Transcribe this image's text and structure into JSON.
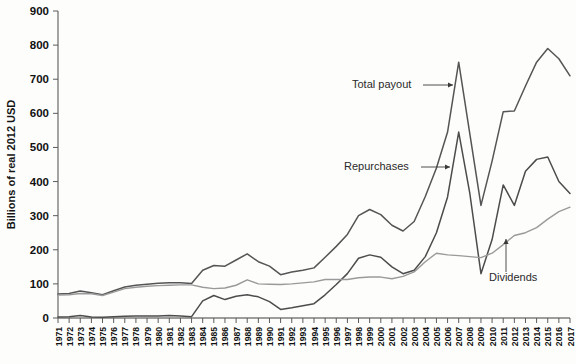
{
  "chart_data": {
    "type": "line",
    "title": "",
    "subtitle": "",
    "xlabel": "",
    "ylabel": "Billions of real 2012 USD",
    "ylim": [
      0,
      900
    ],
    "ytick_values": [
      0,
      100,
      200,
      300,
      400,
      500,
      600,
      700,
      800,
      900
    ],
    "ytick_labels": [
      "0",
      "100",
      "200",
      "300",
      "400",
      "500",
      "600",
      "700",
      "800",
      "900"
    ],
    "grid": false,
    "legend_position": "inline-annotations",
    "x": [
      1971,
      1972,
      1973,
      1974,
      1975,
      1976,
      1977,
      1978,
      1979,
      1980,
      1981,
      1982,
      1983,
      1984,
      1985,
      1986,
      1987,
      1988,
      1989,
      1990,
      1991,
      1992,
      1993,
      1994,
      1995,
      1996,
      1997,
      1998,
      1999,
      2000,
      2001,
      2002,
      2003,
      2004,
      2005,
      2006,
      2007,
      2008,
      2009,
      2010,
      2011,
      2012,
      2013,
      2014,
      2015,
      2016,
      2017
    ],
    "xtick_labels": [
      "1971",
      "1972",
      "1973",
      "1974",
      "1975",
      "1976",
      "1977",
      "1978",
      "1979",
      "1980",
      "1981",
      "1982",
      "1983",
      "1984",
      "1985",
      "1986",
      "1987",
      "1988",
      "1989",
      "1990",
      "1991",
      "1992",
      "1993",
      "1994",
      "1995",
      "1996",
      "1997",
      "1998",
      "1999",
      "2000",
      "2001",
      "2002",
      "2003",
      "2004",
      "2005",
      "2006",
      "2007",
      "2008",
      "2009",
      "2010",
      "2011",
      "2012",
      "2013",
      "2014",
      "2015",
      "2016",
      "2017"
    ],
    "series": [
      {
        "name": "Total payout",
        "color": "#555555",
        "values": [
          70,
          72,
          79,
          74,
          68,
          80,
          91,
          96,
          99,
          102,
          103,
          103,
          101,
          140,
          154,
          152,
          170,
          188,
          165,
          152,
          127,
          135,
          140,
          147,
          178,
          210,
          245,
          300,
          318,
          303,
          272,
          255,
          283,
          356,
          440,
          545,
          750,
          540,
          330,
          460,
          605,
          607,
          680,
          750,
          790,
          760,
          710
        ]
      },
      {
        "name": "Repurchases",
        "color": "#4c4c4c",
        "values": [
          3,
          4,
          7,
          3,
          2,
          4,
          5,
          6,
          6,
          6,
          7,
          6,
          4,
          50,
          66,
          54,
          64,
          68,
          62,
          48,
          25,
          30,
          36,
          42,
          68,
          98,
          130,
          175,
          185,
          178,
          150,
          130,
          140,
          180,
          250,
          355,
          545,
          365,
          130,
          230,
          390,
          330,
          430,
          465,
          472,
          400,
          365
        ]
      },
      {
        "name": "Dividends",
        "color": "#9a9a9a",
        "values": [
          67,
          68,
          72,
          71,
          66,
          76,
          86,
          90,
          93,
          95,
          96,
          97,
          97,
          90,
          86,
          88,
          96,
          112,
          100,
          99,
          98,
          100,
          103,
          106,
          113,
          113,
          113,
          118,
          120,
          120,
          115,
          122,
          135,
          165,
          190,
          185,
          183,
          180,
          177,
          190,
          215,
          242,
          250,
          265,
          290,
          312,
          325
        ]
      }
    ],
    "annotations": [
      {
        "name": "total-payout",
        "label": "Total payout",
        "text_x": 352,
        "text_y": 88,
        "line_x1": 423,
        "line_y1": 85,
        "line_x2": 453,
        "line_y2": 85
      },
      {
        "name": "repurchases",
        "label": "Repurchases",
        "text_x": 344,
        "text_y": 170,
        "line_x1": 421,
        "line_y1": 167,
        "line_x2": 450,
        "line_y2": 167
      },
      {
        "name": "dividends",
        "label": "Dividends",
        "text_x": 489,
        "text_y": 281,
        "line_x1": 506,
        "line_y1": 272,
        "line_x2": 506,
        "line_y2": 239
      }
    ]
  }
}
